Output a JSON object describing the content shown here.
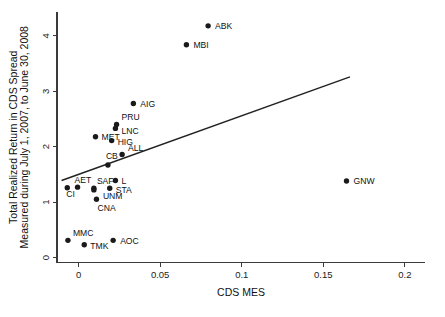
{
  "chart_data": {
    "type": "scatter",
    "title": "",
    "xlabel": "CDS MES",
    "ylabel": "Total Realized Return in CDS Spread\nMeasured during July 1, 2007, to June 30, 2008",
    "ylabel_line1": "Total Realized Return in CDS Spread",
    "ylabel_line2": "Measured during July 1, 2007, to June 30, 2008",
    "xlim": [
      -0.0132,
      0.2123
    ],
    "ylim": [
      -0.09,
      4.43
    ],
    "xticks": [
      0,
      0.05,
      0.1,
      0.15,
      0.2
    ],
    "xticklabels": [
      "0",
      "0.05",
      "0.1",
      "0.15",
      "0.2"
    ],
    "yticks": [
      0,
      1,
      2,
      3,
      4
    ],
    "yticklabels": [
      "0",
      "1",
      "2",
      "3",
      "4"
    ],
    "grid": false,
    "legend": "none",
    "marker_color": "#1a1a1a",
    "line_color": "#222222",
    "frame_color": "#3a3a3a",
    "background": "#ffffff",
    "points": [
      {
        "label": "ABK",
        "x": 0.0794,
        "y": 4.18,
        "lx": 7,
        "ly": 3.2
      },
      {
        "label": "MBI",
        "x": 0.0661,
        "y": 3.84,
        "lx": 7,
        "ly": 3.2
      },
      {
        "label": "AIG",
        "x": 0.0336,
        "y": 2.78,
        "lx": 7,
        "ly": 3.2
      },
      {
        "label": "PRU",
        "x": 0.0233,
        "y": 2.4,
        "lx": 5,
        "ly": -4.5
      },
      {
        "label": "LNC",
        "x": 0.0226,
        "y": 2.33,
        "lx": 6,
        "ly": 5.5
      },
      {
        "label": "MET",
        "x": 0.0104,
        "y": 2.18,
        "lx": 6,
        "ly": 3.2
      },
      {
        "label": "HIG",
        "x": 0.0203,
        "y": 2.11,
        "lx": 6,
        "ly": 4.6
      },
      {
        "label": "ALL",
        "x": 0.0267,
        "y": 1.86,
        "lx": 6,
        "ly": -3.8
      },
      {
        "label": "CB",
        "x": 0.018,
        "y": 1.67,
        "lx": -2,
        "ly": -5.5
      },
      {
        "label": "L",
        "x": 0.0226,
        "y": 1.39,
        "lx": 6,
        "ly": 3.2
      },
      {
        "label": "GNW",
        "x": 0.1642,
        "y": 1.38,
        "lx": 7,
        "ly": 3.2
      },
      {
        "label": "STA",
        "x": 0.0191,
        "y": 1.25,
        "lx": 6,
        "ly": 5.0
      },
      {
        "label": "CI",
        "x": -0.0069,
        "y": 1.26,
        "lx": -1,
        "ly": 9.5
      },
      {
        "label": "AET",
        "x": -0.0006,
        "y": 1.27,
        "lx": -3,
        "ly": -4.0
      },
      {
        "label": "SAF",
        "x": 0.0094,
        "y": 1.25,
        "lx": 3,
        "ly": -4.0
      },
      {
        "label": "UNM",
        "x": 0.0094,
        "y": 1.22,
        "lx": 9,
        "ly": 9.0
      },
      {
        "label": "CNA",
        "x": 0.011,
        "y": 1.05,
        "lx": 1,
        "ly": 11.5
      },
      {
        "label": "MMC",
        "x": -0.0065,
        "y": 0.31,
        "lx": 5,
        "ly": -4.0
      },
      {
        "label": "TMK",
        "x": 0.0035,
        "y": 0.23,
        "lx": 6,
        "ly": 4.2
      },
      {
        "label": "AOC",
        "x": 0.0212,
        "y": 0.31,
        "lx": 7,
        "ly": 3.2
      }
    ],
    "fit_line": {
      "x1": -0.0104,
      "y1": 1.39,
      "x2": 0.1663,
      "y2": 3.26
    }
  },
  "figure": {
    "width": 445,
    "height": 317
  }
}
